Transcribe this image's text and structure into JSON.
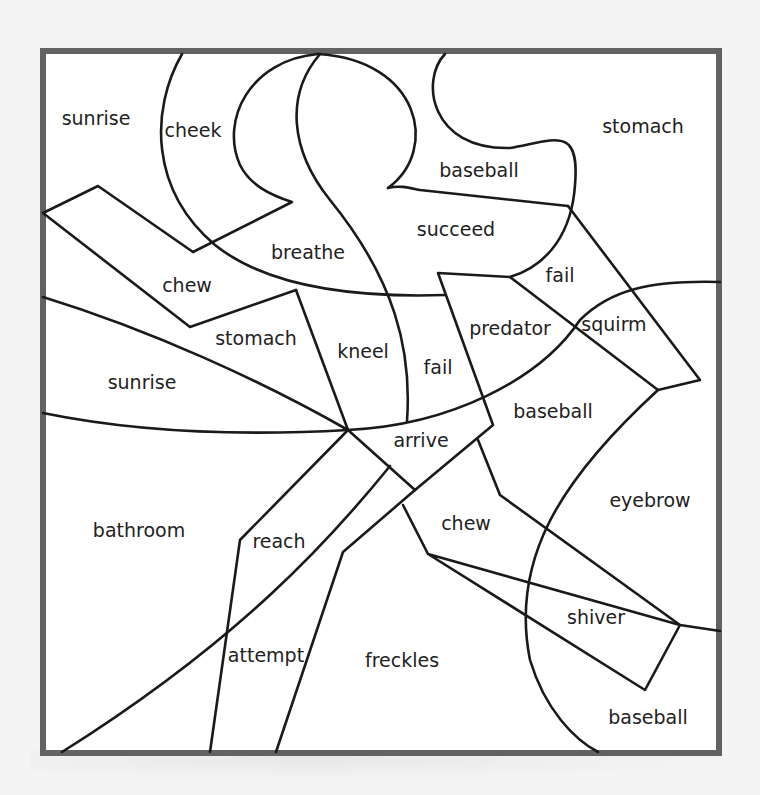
{
  "worksheet": {
    "frame": {
      "x": 40,
      "y": 48,
      "width": 682,
      "height": 708,
      "border_color": "#626262"
    },
    "regions": [
      {
        "word": "sunrise",
        "x": 96,
        "y": 118
      },
      {
        "word": "cheek",
        "x": 193,
        "y": 130
      },
      {
        "word": "stomach",
        "x": 643,
        "y": 126
      },
      {
        "word": "baseball",
        "x": 479,
        "y": 170
      },
      {
        "word": "succeed",
        "x": 456,
        "y": 229
      },
      {
        "word": "breathe",
        "x": 308,
        "y": 252
      },
      {
        "word": "fail",
        "x": 560,
        "y": 275
      },
      {
        "word": "chew",
        "x": 187,
        "y": 285
      },
      {
        "word": "stomach",
        "x": 256,
        "y": 338
      },
      {
        "word": "kneel",
        "x": 363,
        "y": 351
      },
      {
        "word": "predator",
        "x": 510,
        "y": 328
      },
      {
        "word": "squirm",
        "x": 614,
        "y": 324
      },
      {
        "word": "fail",
        "x": 438,
        "y": 367
      },
      {
        "word": "sunrise",
        "x": 142,
        "y": 382
      },
      {
        "word": "baseball",
        "x": 553,
        "y": 411
      },
      {
        "word": "arrive",
        "x": 421,
        "y": 440
      },
      {
        "word": "eyebrow",
        "x": 650,
        "y": 500
      },
      {
        "word": "chew",
        "x": 466,
        "y": 523
      },
      {
        "word": "bathroom",
        "x": 139,
        "y": 530
      },
      {
        "word": "reach",
        "x": 279,
        "y": 541
      },
      {
        "word": "shiver",
        "x": 596,
        "y": 617
      },
      {
        "word": "attempt",
        "x": 266,
        "y": 655
      },
      {
        "word": "freckles",
        "x": 402,
        "y": 660
      },
      {
        "word": "baseball",
        "x": 648,
        "y": 717
      }
    ],
    "lines": [
      {
        "name": "cheek-arc",
        "d": "M182,54 C150,110 150,190 215,245 C265,285 350,298 445,295"
      },
      {
        "name": "breathe-s-curve",
        "d": "M318,54 C250,60 220,120 240,165 C250,185 270,195 292,202 L193,252"
      },
      {
        "name": "kneel-right-curve",
        "d": "M320,54 C285,95 290,150 330,200 C395,280 412,350 407,421"
      },
      {
        "name": "succeed-lobe",
        "d": "M318,54 C420,60 440,150 388,188"
      },
      {
        "name": "baseball-blob",
        "d": "M445,54 C420,80 430,150 510,148 C555,140 580,125 575,185 C572,230 550,265 510,277"
      },
      {
        "name": "baseball-bottom-edge",
        "d": "M388,188 C400,185 410,188 420,190 L568,206"
      },
      {
        "name": "fail-right-edge",
        "d": "M568,206 L700,380 L658,390 L510,277 L438,273 L493,425 L415,490"
      },
      {
        "name": "chew-upper-quad",
        "d": "M43,213 L98,186 L193,252"
      },
      {
        "name": "chew-lower-quad",
        "d": "M43,213 L190,327 L296,290"
      },
      {
        "name": "stomach-top",
        "d": "M296,290 L348,430"
      },
      {
        "name": "sunrise-upper-edge",
        "d": "M43,297 C150,330 260,380 348,430"
      },
      {
        "name": "sunrise-lower-edge",
        "d": "M43,413 C150,435 260,435 348,430 C450,425 540,380 580,320 C610,290 650,280 720,282"
      },
      {
        "name": "arrive-left-diag",
        "d": "M348,430 L415,490"
      },
      {
        "name": "reach-left",
        "d": "M348,430 L240,540 L210,752"
      },
      {
        "name": "attempt-diag",
        "d": "M390,466 C330,540 240,640 62,752"
      },
      {
        "name": "freckles-left",
        "d": "M415,490 L343,552 L276,752"
      },
      {
        "name": "chew-right-left-edge",
        "d": "M403,505 L428,554 L680,625 L645,690 L428,554"
      },
      {
        "name": "chew-right-upper",
        "d": "M478,440 L500,495 L680,625 L720,631"
      },
      {
        "name": "eyebrow-arc",
        "d": "M658,390 C560,480 510,560 530,660 C545,710 575,740 598,752"
      }
    ]
  }
}
